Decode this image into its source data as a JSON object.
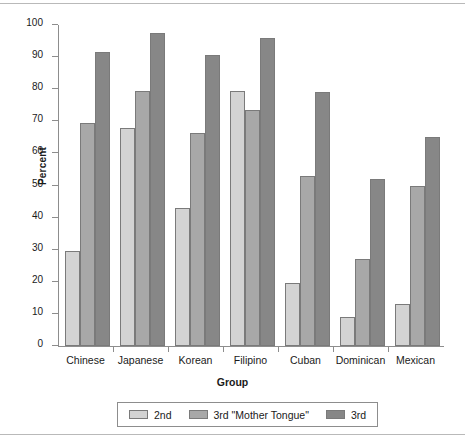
{
  "chart_data": {
    "type": "bar",
    "title": "",
    "xlabel": "Group",
    "ylabel": "Percent",
    "ylim": [
      0,
      100
    ],
    "yticks": [
      0,
      10,
      20,
      30,
      40,
      50,
      60,
      70,
      80,
      90,
      100
    ],
    "grid": false,
    "legend_position": "bottom",
    "categories": [
      "Chinese",
      "Japanese",
      "Korean",
      "Filipino",
      "Cuban",
      "Dominican",
      "Mexican"
    ],
    "series": [
      {
        "name": "2nd",
        "color": "#d3d3d3",
        "values": [
          29.5,
          68.0,
          43.0,
          79.5,
          19.5,
          9.0,
          13.0
        ]
      },
      {
        "name": "3rd \"Mother Tongue\"",
        "color": "#a8a8a8",
        "values": [
          69.5,
          79.5,
          66.5,
          73.5,
          53.0,
          27.0,
          50.0
        ]
      },
      {
        "name": "3rd",
        "color": "#878787",
        "values": [
          91.5,
          97.5,
          90.8,
          96.0,
          79.0,
          52.0,
          65.0
        ]
      }
    ]
  },
  "axes": {
    "y_label": "Percent",
    "x_label": "Group",
    "y_tick_labels": [
      "100",
      "90",
      "80",
      "70",
      "60",
      "50",
      "40",
      "30",
      "20",
      "10",
      "0"
    ]
  },
  "legend": {
    "items": [
      {
        "label": "2nd"
      },
      {
        "label": "3rd \"Mother Tongue\""
      },
      {
        "label": "3rd"
      }
    ]
  }
}
